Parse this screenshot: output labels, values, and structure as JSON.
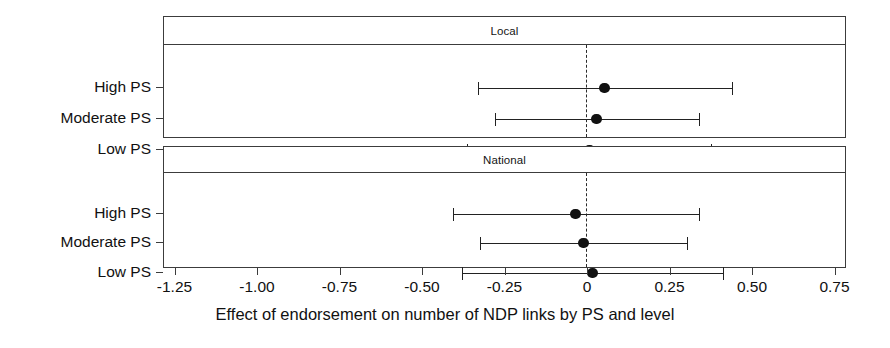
{
  "chart_data": {
    "type": "scatter",
    "title": "",
    "xlabel": "Effect of endorsement on number of NDP links by PS and level",
    "ylabel": "",
    "xlim": [
      -1.38,
      0.785
    ],
    "xticks": [
      -1.25,
      -1.0,
      -0.75,
      -0.5,
      -0.25,
      0,
      0.25,
      0.5,
      0.75
    ],
    "xticklabels": [
      "-1.25",
      "-1.00",
      "-0.75",
      "-0.50",
      "-0.25",
      "0",
      "0.25",
      "0.50",
      "0.75"
    ],
    "categories": [
      "High PS",
      "Moderate PS",
      "Low PS"
    ],
    "grid": false,
    "legend": null,
    "reference_line": {
      "value": 0,
      "style": "dashed"
    },
    "panels": [
      {
        "label": "Local",
        "points": [
          {
            "category": "High PS",
            "estimate": 0.055,
            "ci_low": -0.327,
            "ci_high": 0.442
          },
          {
            "category": "Moderate PS",
            "estimate": 0.03,
            "ci_low": -0.276,
            "ci_high": 0.342
          },
          {
            "category": "Low PS",
            "estimate": 0.009,
            "ci_low": -0.361,
            "ci_high": 0.379
          }
        ]
      },
      {
        "label": "National",
        "points": [
          {
            "category": "High PS",
            "estimate": -0.033,
            "ci_low": -0.403,
            "ci_high": 0.342
          },
          {
            "category": "Moderate PS",
            "estimate": -0.009,
            "ci_low": -0.321,
            "ci_high": 0.306
          },
          {
            "category": "Low PS",
            "estimate": 0.018,
            "ci_low": -0.376,
            "ci_high": 0.415
          }
        ]
      }
    ]
  },
  "colors": {
    "point": "#111111",
    "line": "#222222",
    "frame": "#3c3c3c",
    "background": "#ffffff"
  }
}
